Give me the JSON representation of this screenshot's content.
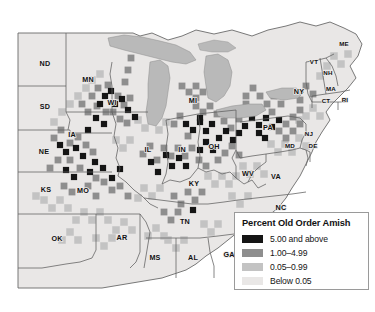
{
  "figure": {
    "kind": "choropleth-map",
    "region": "Eastern and Central United States",
    "background_color": "#ffffff"
  },
  "palette": {
    "class_5_and_above": "#151515",
    "class_1_to_4_99": "#8e8e8e",
    "class_0_05_to_0_99": "#c3c3c3",
    "class_below_0_05": "#e9e7e6",
    "water": "#b9b9b9",
    "state_border": "#5d5d5d",
    "county_border": "#cfcdcc",
    "coastline": "#6a6a6a",
    "legend_border": "#9a9a9a",
    "legend_background": "#ffffff",
    "label_color": "#111111"
  },
  "legend": {
    "title": "Percent Old Order Amish",
    "items": [
      {
        "label": "5.00 and above",
        "color": "#151515"
      },
      {
        "label": "1.00–4.99",
        "color": "#8e8e8e"
      },
      {
        "label": "0.05–0.99",
        "color": "#c3c3c3"
      },
      {
        "label": "Below 0.05",
        "color": "#e9e7e6"
      }
    ]
  },
  "state_labels": [
    {
      "abbr": "ND",
      "x": 45,
      "y": 64,
      "size": "normal"
    },
    {
      "abbr": "SD",
      "x": 45,
      "y": 107,
      "size": "normal"
    },
    {
      "abbr": "NE",
      "x": 44,
      "y": 152,
      "size": "normal"
    },
    {
      "abbr": "KS",
      "x": 46,
      "y": 190,
      "size": "normal"
    },
    {
      "abbr": "OK",
      "x": 57,
      "y": 239,
      "size": "normal"
    },
    {
      "abbr": "MN",
      "x": 88,
      "y": 80,
      "size": "normal"
    },
    {
      "abbr": "IA",
      "x": 72,
      "y": 135,
      "size": "normal"
    },
    {
      "abbr": "MO",
      "x": 83,
      "y": 191,
      "size": "normal"
    },
    {
      "abbr": "AR",
      "x": 122,
      "y": 238,
      "size": "normal"
    },
    {
      "abbr": "WI",
      "x": 112,
      "y": 103,
      "size": "normal"
    },
    {
      "abbr": "IL",
      "x": 148,
      "y": 150,
      "size": "normal"
    },
    {
      "abbr": "MI",
      "x": 193,
      "y": 101,
      "size": "normal"
    },
    {
      "abbr": "IN",
      "x": 182,
      "y": 150,
      "size": "normal"
    },
    {
      "abbr": "OH",
      "x": 214,
      "y": 147,
      "size": "normal"
    },
    {
      "abbr": "KY",
      "x": 194,
      "y": 184,
      "size": "normal"
    },
    {
      "abbr": "TN",
      "x": 185,
      "y": 222,
      "size": "normal"
    },
    {
      "abbr": "MS",
      "x": 155,
      "y": 258,
      "size": "normal"
    },
    {
      "abbr": "AL",
      "x": 193,
      "y": 258,
      "size": "normal"
    },
    {
      "abbr": "GA",
      "x": 229,
      "y": 255,
      "size": "normal"
    },
    {
      "abbr": "WV",
      "x": 248,
      "y": 174,
      "size": "normal"
    },
    {
      "abbr": "VA",
      "x": 276,
      "y": 177,
      "size": "normal"
    },
    {
      "abbr": "NC",
      "x": 281,
      "y": 208,
      "size": "normal"
    },
    {
      "abbr": "PA",
      "x": 268,
      "y": 128,
      "size": "normal"
    },
    {
      "abbr": "NY",
      "x": 299,
      "y": 92,
      "size": "normal"
    },
    {
      "abbr": "NJ",
      "x": 309,
      "y": 134,
      "size": "sm"
    },
    {
      "abbr": "MD",
      "x": 290,
      "y": 146,
      "size": "sm"
    },
    {
      "abbr": "DE",
      "x": 313,
      "y": 146,
      "size": "sm"
    },
    {
      "abbr": "VT",
      "x": 314,
      "y": 62,
      "size": "sm"
    },
    {
      "abbr": "NH",
      "x": 328,
      "y": 73,
      "size": "sm"
    },
    {
      "abbr": "ME",
      "x": 344,
      "y": 44,
      "size": "sm"
    },
    {
      "abbr": "MA",
      "x": 331,
      "y": 89,
      "size": "sm"
    },
    {
      "abbr": "CT",
      "x": 326,
      "y": 101,
      "size": "sm"
    },
    {
      "abbr": "RI",
      "x": 345,
      "y": 100,
      "size": "sm"
    }
  ],
  "counties": {
    "note": "county cells shaded by Old Order Amish percentage class",
    "class_dark": [
      [
        105,
        96
      ],
      [
        111,
        91
      ],
      [
        100,
        104
      ],
      [
        115,
        104
      ],
      [
        96,
        118
      ],
      [
        104,
        124
      ],
      [
        88,
        130
      ],
      [
        60,
        145
      ],
      [
        66,
        152
      ],
      [
        76,
        148
      ],
      [
        83,
        156
      ],
      [
        95,
        162
      ],
      [
        103,
        168
      ],
      [
        90,
        172
      ],
      [
        112,
        178
      ],
      [
        120,
        169
      ],
      [
        74,
        177
      ],
      [
        66,
        170
      ],
      [
        186,
        124
      ],
      [
        193,
        130
      ],
      [
        200,
        122
      ],
      [
        206,
        131
      ],
      [
        212,
        124
      ],
      [
        206,
        142
      ],
      [
        213,
        150
      ],
      [
        219,
        138
      ],
      [
        200,
        150
      ],
      [
        226,
        131
      ],
      [
        252,
        118
      ],
      [
        259,
        125
      ],
      [
        266,
        118
      ],
      [
        272,
        127
      ],
      [
        259,
        133
      ],
      [
        245,
        126
      ],
      [
        279,
        120
      ],
      [
        265,
        138
      ],
      [
        239,
        133
      ],
      [
        151,
        162
      ],
      [
        158,
        172
      ],
      [
        166,
        155
      ],
      [
        172,
        166
      ],
      [
        179,
        158
      ],
      [
        186,
        166
      ],
      [
        128,
        110
      ],
      [
        135,
        117
      ],
      [
        122,
        99
      ],
      [
        193,
        210
      ],
      [
        200,
        118
      ],
      [
        233,
        140
      ],
      [
        246,
        112
      ]
    ],
    "class_mid": [
      [
        98,
        88
      ],
      [
        92,
        96
      ],
      [
        108,
        85
      ],
      [
        118,
        96
      ],
      [
        124,
        105
      ],
      [
        130,
        98
      ],
      [
        113,
        112
      ],
      [
        106,
        112
      ],
      [
        97,
        106
      ],
      [
        88,
        112
      ],
      [
        82,
        104
      ],
      [
        120,
        119
      ],
      [
        127,
        123
      ],
      [
        54,
        138
      ],
      [
        61,
        130
      ],
      [
        70,
        143
      ],
      [
        78,
        137
      ],
      [
        86,
        145
      ],
      [
        93,
        152
      ],
      [
        70,
        160
      ],
      [
        58,
        160
      ],
      [
        50,
        168
      ],
      [
        80,
        168
      ],
      [
        96,
        178
      ],
      [
        104,
        182
      ],
      [
        112,
        190
      ],
      [
        88,
        186
      ],
      [
        120,
        186
      ],
      [
        64,
        186
      ],
      [
        72,
        192
      ],
      [
        128,
        196
      ],
      [
        96,
        196
      ],
      [
        180,
        116
      ],
      [
        174,
        124
      ],
      [
        188,
        136
      ],
      [
        196,
        106
      ],
      [
        203,
        112
      ],
      [
        210,
        106
      ],
      [
        217,
        114
      ],
      [
        224,
        121
      ],
      [
        231,
        128
      ],
      [
        218,
        160
      ],
      [
        225,
        153
      ],
      [
        232,
        146
      ],
      [
        239,
        155
      ],
      [
        246,
        104
      ],
      [
        253,
        110
      ],
      [
        239,
        119
      ],
      [
        272,
        112
      ],
      [
        279,
        131
      ],
      [
        286,
        124
      ],
      [
        293,
        117
      ],
      [
        300,
        110
      ],
      [
        286,
        138
      ],
      [
        293,
        131
      ],
      [
        300,
        124
      ],
      [
        143,
        154
      ],
      [
        150,
        146
      ],
      [
        157,
        160
      ],
      [
        164,
        148
      ],
      [
        171,
        156
      ],
      [
        178,
        148
      ],
      [
        185,
        156
      ],
      [
        192,
        148
      ],
      [
        199,
        160
      ],
      [
        206,
        166
      ],
      [
        174,
        196
      ],
      [
        181,
        204
      ],
      [
        188,
        192
      ],
      [
        195,
        200
      ],
      [
        202,
        192
      ],
      [
        164,
        212
      ],
      [
        171,
        220
      ],
      [
        178,
        212
      ],
      [
        196,
        86
      ],
      [
        203,
        92
      ],
      [
        210,
        86
      ],
      [
        189,
        92
      ],
      [
        196,
        98
      ],
      [
        182,
        86
      ],
      [
        246,
        96
      ],
      [
        253,
        88
      ],
      [
        260,
        96
      ],
      [
        267,
        104
      ],
      [
        274,
        96
      ],
      [
        281,
        104
      ],
      [
        306,
        86
      ],
      [
        313,
        94
      ],
      [
        300,
        100
      ],
      [
        293,
        94
      ],
      [
        131,
        58
      ],
      [
        128,
        70
      ],
      [
        125,
        82
      ]
    ],
    "class_light": [
      [
        92,
        80
      ],
      [
        100,
        74
      ],
      [
        86,
        88
      ],
      [
        78,
        96
      ],
      [
        70,
        104
      ],
      [
        62,
        112
      ],
      [
        54,
        122
      ],
      [
        44,
        200
      ],
      [
        52,
        208
      ],
      [
        60,
        200
      ],
      [
        68,
        208
      ],
      [
        36,
        196
      ],
      [
        84,
        212
      ],
      [
        92,
        220
      ],
      [
        100,
        212
      ],
      [
        108,
        220
      ],
      [
        76,
        220
      ],
      [
        116,
        230
      ],
      [
        124,
        222
      ],
      [
        132,
        230
      ],
      [
        144,
        188
      ],
      [
        152,
        196
      ],
      [
        160,
        188
      ],
      [
        138,
        198
      ],
      [
        156,
        228
      ],
      [
        148,
        236
      ],
      [
        164,
        236
      ],
      [
        208,
        176
      ],
      [
        215,
        184
      ],
      [
        222,
        176
      ],
      [
        229,
        184
      ],
      [
        236,
        176
      ],
      [
        243,
        166
      ],
      [
        250,
        174
      ],
      [
        257,
        166
      ],
      [
        264,
        174
      ],
      [
        271,
        144
      ],
      [
        278,
        152
      ],
      [
        285,
        144
      ],
      [
        292,
        152
      ],
      [
        299,
        138
      ],
      [
        306,
        146
      ],
      [
        313,
        108
      ],
      [
        320,
        116
      ],
      [
        306,
        116
      ],
      [
        299,
        120
      ],
      [
        320,
        76
      ],
      [
        327,
        66
      ],
      [
        334,
        56
      ],
      [
        341,
        64
      ],
      [
        348,
        54
      ],
      [
        168,
        240
      ],
      [
        176,
        248
      ],
      [
        184,
        240
      ],
      [
        204,
        224
      ],
      [
        211,
        232
      ],
      [
        218,
        224
      ],
      [
        232,
        196
      ],
      [
        240,
        204
      ],
      [
        248,
        196
      ],
      [
        138,
        120
      ],
      [
        145,
        128
      ],
      [
        152,
        120
      ],
      [
        159,
        130
      ],
      [
        166,
        122
      ],
      [
        116,
        140
      ],
      [
        123,
        148
      ],
      [
        130,
        140
      ],
      [
        70,
        232
      ],
      [
        78,
        240
      ],
      [
        62,
        240
      ],
      [
        96,
        238
      ],
      [
        104,
        246
      ],
      [
        112,
        238
      ]
    ]
  }
}
